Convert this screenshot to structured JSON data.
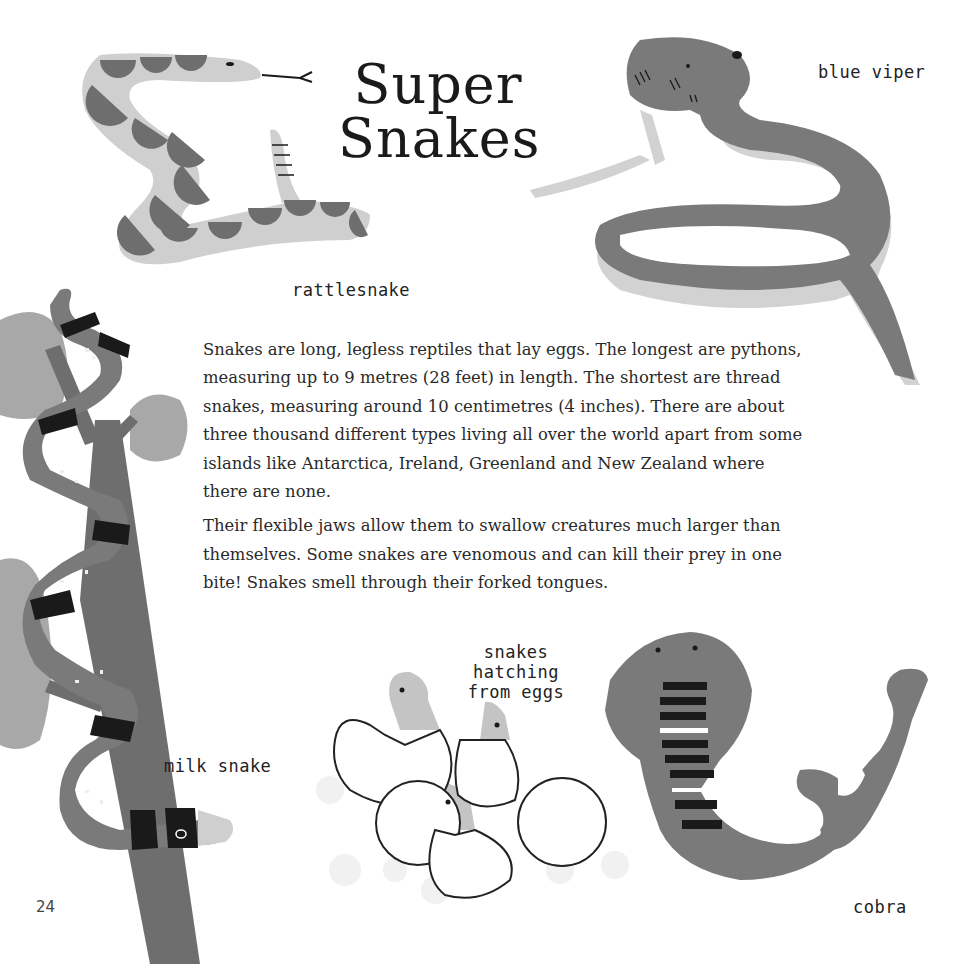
{
  "page": {
    "title_line1": "Super",
    "title_line2": "Snakes",
    "page_number": "24"
  },
  "labels": {
    "rattlesnake": "rattlesnake",
    "blue_viper": "blue viper",
    "milk_snake": "milk snake",
    "hatching_line1": "snakes hatching",
    "hatching_line2": "from eggs",
    "cobra": "cobra"
  },
  "body": {
    "paragraphs": [
      "Snakes are long, legless reptiles that lay eggs. The longest are pythons, measuring up to 9 metres (28 feet) in length. The shortest are thread snakes, measuring around 10 centimetres (4 inches). There are about three thousand different types living all over the world apart from some islands like Antarctica, Ireland, Greenland and New Zealand where there are none.",
      "Their flexible jaws allow them to swallow creatures much larger than themselves. Some snakes are venomous and can kill their prey in one bite! Snakes smell through their forked tongues."
    ]
  },
  "colors": {
    "snake_gray": "#7a7a7a",
    "light_gray": "#c8c8c8",
    "dark": "#1a1a1a",
    "blob_gray": "#a8a8a8"
  }
}
